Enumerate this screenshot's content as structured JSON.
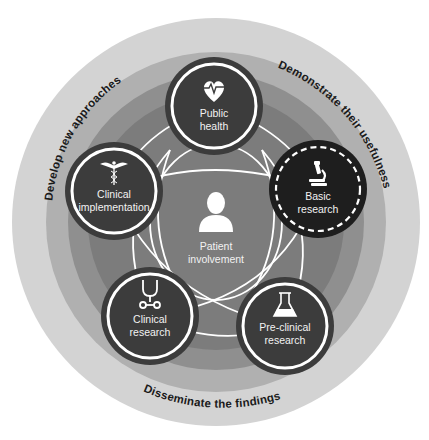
{
  "diagram": {
    "colors": {
      "background": "#ffffff",
      "ring_outer": "#d3d3d3",
      "ring_middle": "#b0b0b0",
      "ring_inner": "#8f8f8f",
      "core": "#7c7c7c",
      "node_fill": "#3c3c3c",
      "node_fill_highlight": "#1e1e1e",
      "node_stroke": "#ffffff",
      "connector": "#ffffff",
      "ring_text": "#1a1a1a",
      "node_text": "#f2f2f2"
    },
    "outer_labels": {
      "top_left": "Develop new approaches",
      "top_right": "Demonstrate their usefulness",
      "bottom": "Disseminate the findings"
    },
    "center": {
      "icon": "person-icon",
      "line1": "Patient",
      "line2": "involvement"
    },
    "nodes": [
      {
        "id": "public-health",
        "icon": "heart-pulse-icon",
        "line1": "Public",
        "line2": "health",
        "border": "solid"
      },
      {
        "id": "basic-research",
        "icon": "microscope-icon",
        "line1": "Basic",
        "line2": "research",
        "border": "dashed"
      },
      {
        "id": "pre-clinical-research",
        "icon": "flask-icon",
        "line1": "Pre-clinical",
        "line2": "research",
        "border": "solid"
      },
      {
        "id": "clinical-research",
        "icon": "stethoscope-icon",
        "line1": "Clinical",
        "line2": "research",
        "border": "solid"
      },
      {
        "id": "clinical-implementation",
        "icon": "caduceus-icon",
        "line1": "Clinical",
        "line2": "implementation",
        "border": "solid"
      }
    ]
  }
}
